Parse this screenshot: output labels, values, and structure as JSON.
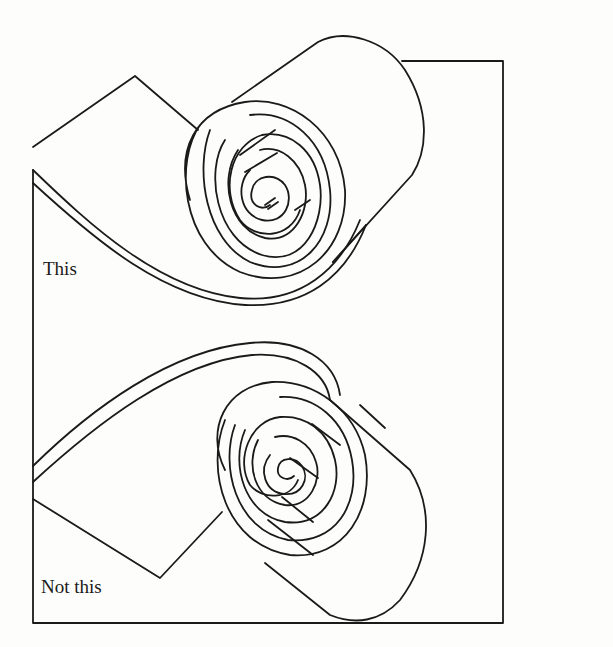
{
  "figure": {
    "stroke_color": "#1a1a1a",
    "background_color": "#fdfdfb",
    "panels": [
      {
        "position": "top",
        "label": "This"
      },
      {
        "position": "bottom",
        "label": "Not this"
      }
    ]
  }
}
